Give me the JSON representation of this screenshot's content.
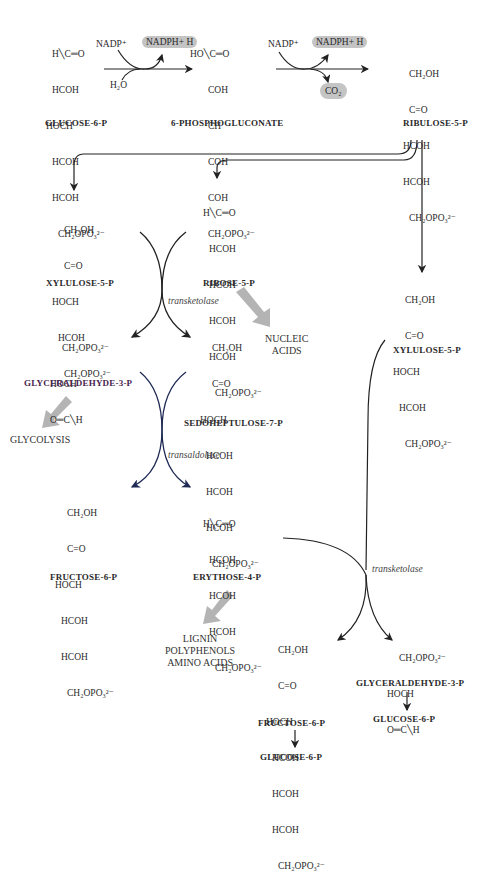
{
  "colors": {
    "ink": "#2a2a2a",
    "gray_arrow": "#b4b4b4",
    "pill_bg": "#c4c4c4",
    "curve_blue": "#1f2a55",
    "g3p_label": "#5a2a5a"
  },
  "oxidative": {
    "glucose6p": {
      "name": "GLUCOSE-6-P",
      "rows": [
        "H╲C═O",
        "HCOH",
        "HOCH",
        "HCOH",
        "HCOH",
        "CH₂OPO₃²⁻"
      ]
    },
    "step1": {
      "in": "NADP⁺",
      "out": "NADPH+ H",
      "water": "H₂O"
    },
    "phosphogluconate": {
      "name": "6-PHOSPHOGLUCONATE",
      "rows": [
        "HO╲C═O",
        "COH",
        "CH",
        "COH",
        "COH",
        "CH₂OPO₃²⁻"
      ]
    },
    "step2": {
      "in": "NADP⁺",
      "out": "NADPH+ H",
      "co2": "CO₂"
    },
    "ribulose5p": {
      "name": "RIBULOSE-5-P",
      "rows": [
        "CH₂OH",
        "C=O",
        "HCOH",
        "HCOH",
        "CH₂OPO₃²⁻"
      ]
    }
  },
  "nonoxidative": {
    "xylulose5p_left": {
      "name": "XYLULOSE-5-P",
      "rows": [
        "CH₂OH",
        "C=O",
        "HOCH",
        "HCOH",
        "CH₂OPO₃²⁻"
      ]
    },
    "ribose5p": {
      "name": "RIBOSE-5-P",
      "rows": [
        "H╲C═O",
        "HCOH",
        "HCOH",
        "HCOH",
        "HCOH",
        "CH₂OPO₃²⁻"
      ]
    },
    "xylulose5p_right": {
      "name": "XYLULOSE-5-P",
      "rows": [
        "CH₂OH",
        "C=O",
        "HOCH",
        "HCOH",
        "CH₂OPO₃²⁻"
      ]
    },
    "enzyme1": "transketolase",
    "g3p_left": {
      "name": "GLYCERALDEHYDE-3-P",
      "rows": [
        "CH₂OPO₃²⁻",
        "HOCH",
        "O═C╲H"
      ]
    },
    "sedoheptulose7p": {
      "name": "SEDOHEPTULOSE-7-P",
      "rows": [
        "CH₂OH",
        "C=O",
        "HOCH",
        "HCOH",
        "HCOH",
        "HCOH",
        "CH₂OPO₃²⁻"
      ]
    },
    "nucleic_acids": [
      "NUCLEIC",
      "ACIDS"
    ],
    "glycolysis": "GLYCOLYSIS",
    "enzyme2": "transaldolase",
    "fructose6p_left": {
      "name": "FRUCTOSE-6-P",
      "rows": [
        "CH₂OH",
        "C=O",
        "HOCH",
        "HCOH",
        "HCOH",
        "CH₂OPO₃²⁻"
      ]
    },
    "erythrose4p": {
      "name": "ERYTHOSE-4-P",
      "rows": [
        "H╲C═O",
        "HCOH",
        "HCOH",
        "HCOH",
        "CH₂OPO₃²⁻"
      ]
    },
    "enzyme3": "transketolase",
    "lignin": [
      "LIGNIN",
      "POLYPHENOLS",
      "AMINO ACIDS"
    ],
    "fructose6p_bottom": {
      "name": "FRUCTOSE-6-P",
      "rows": [
        "CH₂OH",
        "C=O",
        "HOCH",
        "HCOH",
        "HCOH",
        "HCOH",
        "CH₂OPO₃²⁻"
      ],
      "to": "GLUCOSE-6-P"
    },
    "g3p_bottom": {
      "name": "GLYCERALDEHYDE-3-P",
      "rows": [
        "CH₂OPO₃²⁻",
        "HOCH",
        "O═C╲H"
      ],
      "to": "GLUCOSE-6-P"
    }
  }
}
